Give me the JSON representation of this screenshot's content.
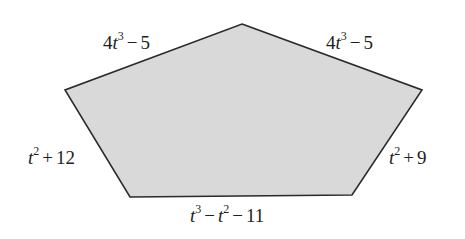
{
  "figure": {
    "type": "pentagon",
    "fill_color": "#d9d9d9",
    "stroke_color": "#2a2a2a",
    "vertices": {
      "top": [
        242,
        24
      ],
      "right": [
        422,
        90
      ],
      "bottom_right": [
        352,
        195
      ],
      "bottom_left": [
        130,
        197
      ],
      "left": [
        65,
        90
      ]
    }
  },
  "sides": {
    "top_left": {
      "coef": "4",
      "var": "t",
      "exp": "3",
      "op": "−",
      "const": "5"
    },
    "top_right": {
      "coef": "4",
      "var": "t",
      "exp": "3",
      "op": "−",
      "const": "5"
    },
    "left": {
      "var": "t",
      "exp": "2",
      "op": "+",
      "const": "12"
    },
    "right": {
      "var": "t",
      "exp": "2",
      "op": "+",
      "const": "9"
    },
    "bottom": {
      "var1": "t",
      "exp1": "3",
      "op1": "−",
      "var2": "t",
      "exp2": "2",
      "op2": "−",
      "const": "11"
    }
  }
}
